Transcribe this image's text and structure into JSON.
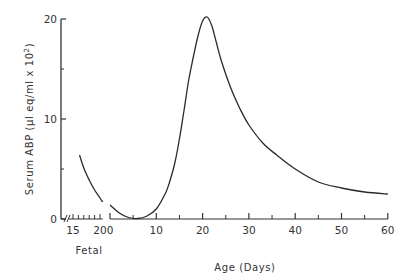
{
  "chart_data": {
    "type": "line",
    "title": "",
    "xlabel": "Age (Days)",
    "ylabel": "Serum ABP (µl eq/ml x 10²)",
    "ylabel_base": "Serum ABP (µl eq/ml x 10",
    "ylabel_sup": "2",
    "ylabel_close": ")",
    "ylim": [
      0,
      20
    ],
    "xlim": [
      0,
      60
    ],
    "grid": false,
    "legend": null,
    "y_ticks": [
      0,
      10,
      20
    ],
    "y_minor_ticks": [
      5,
      15
    ],
    "x_ticks": [
      0,
      10,
      20,
      30,
      40,
      50,
      60
    ],
    "x_minor_ticks": [
      5,
      15,
      25,
      35,
      45,
      55
    ],
    "fetal_axis": {
      "label": "Fetal",
      "ticks": [
        15,
        20
      ],
      "minor_ticks": [
        16,
        17,
        18,
        19
      ],
      "range": [
        14,
        21
      ]
    },
    "series": [
      {
        "name": "Fetal",
        "x": [
          16.2,
          17,
          18,
          19,
          20,
          20.5
        ],
        "y": [
          6.4,
          5.1,
          3.9,
          2.9,
          2.1,
          1.7
        ]
      },
      {
        "name": "Postnatal",
        "x": [
          0,
          2,
          4,
          6,
          8,
          10,
          12,
          13,
          14,
          15,
          16,
          17,
          18,
          19,
          20,
          21,
          22,
          23,
          24,
          26,
          28,
          30,
          33,
          36,
          40,
          45,
          50,
          55,
          60
        ],
        "y": [
          1.4,
          0.6,
          0.15,
          0.05,
          0.3,
          1.0,
          2.6,
          3.9,
          5.6,
          8.0,
          10.9,
          13.9,
          16.2,
          18.3,
          19.8,
          20.2,
          19.3,
          17.6,
          15.9,
          13.2,
          11.1,
          9.4,
          7.6,
          6.4,
          5.0,
          3.7,
          3.1,
          2.7,
          2.5
        ]
      }
    ],
    "tick_labels": {
      "y": [
        "0",
        "10",
        "20"
      ],
      "x": [
        "0",
        "10",
        "20",
        "30",
        "40",
        "50",
        "60"
      ],
      "fetal": [
        "15",
        "20"
      ]
    }
  }
}
